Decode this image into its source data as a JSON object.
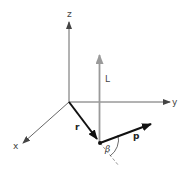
{
  "diagram": {
    "axes": {
      "z": {
        "label": "z"
      },
      "y": {
        "label": "y"
      },
      "x": {
        "label": "x"
      }
    },
    "vectors": {
      "r": {
        "label": "r",
        "color": "#111111"
      },
      "L": {
        "label": "L",
        "color": "#9a9a9a"
      },
      "p": {
        "label": "p",
        "color": "#111111"
      }
    },
    "angle": {
      "label": "β"
    },
    "colors": {
      "axis": "#555555",
      "background": "#ffffff"
    }
  }
}
